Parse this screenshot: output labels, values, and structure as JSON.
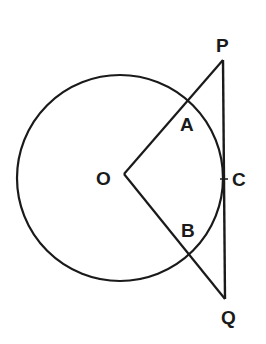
{
  "diagram": {
    "type": "geometry",
    "circle": {
      "center": "O",
      "cx": 120,
      "cy": 178,
      "r": 103
    },
    "points": {
      "O": {
        "label": "O",
        "x": 124,
        "y": 178
      },
      "P": {
        "label": "P",
        "x": 223,
        "y": 60
      },
      "Q": {
        "label": "Q",
        "x": 225,
        "y": 299
      },
      "A": {
        "label": "A",
        "x": 187,
        "y": 102
      },
      "B": {
        "label": "B",
        "x": 188,
        "y": 254
      },
      "C": {
        "label": "C",
        "x": 224,
        "y": 179
      }
    },
    "segments": [
      [
        "O",
        "P"
      ],
      [
        "O",
        "Q"
      ],
      [
        "P",
        "Q"
      ]
    ],
    "labels": {
      "P": "P",
      "A": "A",
      "O": "O",
      "C": "C",
      "B": "B",
      "Q": "Q"
    },
    "stroke_color": "#1a1a1a"
  }
}
